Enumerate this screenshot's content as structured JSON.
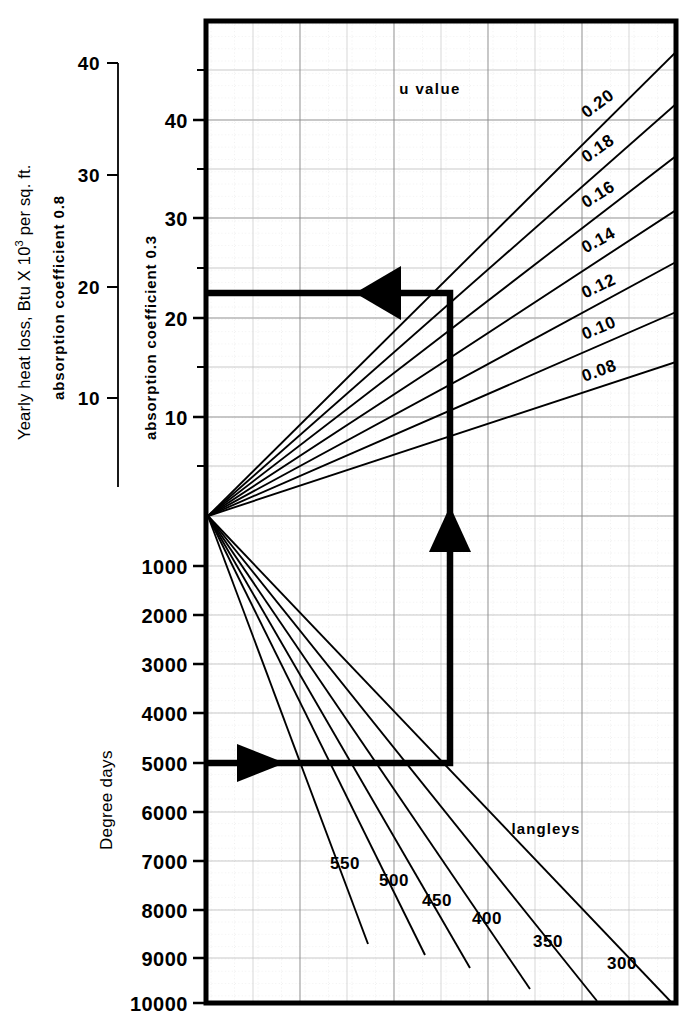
{
  "figure": {
    "type": "nomograph",
    "background": "#ffffff",
    "ink": "#000000",
    "gridline_color": "#9a9a9a",
    "subgrid_color": "#c9c9c9"
  },
  "left_outer_axis": {
    "title_line1": "Yearly heat loss, Btu X 10",
    "title_sup": "3",
    "title_line1_tail": " per sq. ft.",
    "title_line2": "absorption  coefficient  0.8",
    "ticks": [
      {
        "label": "40",
        "value": 40,
        "y": 63
      },
      {
        "label": "30",
        "value": 30,
        "y": 175
      },
      {
        "label": "20",
        "value": 20,
        "y": 287
      },
      {
        "label": "10",
        "value": 10,
        "y": 398
      }
    ],
    "axis_top_y": 63,
    "axis_bottom_y": 487,
    "axis_x": 118
  },
  "left_inner_axis": {
    "title": "absorption coefficient 0.3",
    "ticks": [
      {
        "label": "40",
        "value": 40,
        "y": 120
      },
      {
        "label": "30",
        "value": 30,
        "y": 218
      },
      {
        "label": "20",
        "value": 20,
        "y": 318
      },
      {
        "label": "10",
        "value": 10,
        "y": 417
      }
    ],
    "minor_ticks_y": [
      70,
      169,
      268,
      367,
      466
    ]
  },
  "degree_days_axis": {
    "title": "Degree days",
    "ticks": [
      {
        "label": "1000",
        "value": 1000,
        "y": 566
      },
      {
        "label": "2000",
        "value": 2000,
        "y": 615
      },
      {
        "label": "3000",
        "value": 3000,
        "y": 664
      },
      {
        "label": "4000",
        "value": 4000,
        "y": 713
      },
      {
        "label": "5000",
        "value": 5000,
        "y": 763
      },
      {
        "label": "6000",
        "value": 6000,
        "y": 812
      },
      {
        "label": "7000",
        "value": 7000,
        "y": 861
      },
      {
        "label": "8000",
        "value": 8000,
        "y": 910
      },
      {
        "label": "9000",
        "value": 9000,
        "y": 958
      },
      {
        "label": "10000",
        "value": 10000,
        "y": 1003
      }
    ]
  },
  "top_family": {
    "legend_label": "u value",
    "legend_x": 430,
    "legend_y": 89,
    "origin": {
      "x": 208,
      "y": 516
    },
    "lines": [
      {
        "label": "0.20",
        "value": 0.2,
        "end_x": 676,
        "end_y": 52,
        "lbl_x": 600,
        "lbl_y": 108,
        "rot": -36
      },
      {
        "label": "0.18",
        "value": 0.18,
        "end_x": 676,
        "end_y": 104,
        "lbl_x": 600,
        "lbl_y": 153,
        "rot": -34
      },
      {
        "label": "0.16",
        "value": 0.16,
        "end_x": 676,
        "end_y": 156,
        "lbl_x": 600,
        "lbl_y": 199,
        "rot": -31
      },
      {
        "label": "0.14",
        "value": 0.14,
        "end_x": 676,
        "end_y": 210,
        "lbl_x": 600,
        "lbl_y": 245,
        "rot": -28
      },
      {
        "label": "0.12",
        "value": 0.12,
        "end_x": 676,
        "end_y": 262,
        "lbl_x": 600,
        "lbl_y": 291,
        "rot": -25
      },
      {
        "label": "0.10",
        "value": 0.1,
        "end_x": 676,
        "end_y": 312,
        "lbl_x": 600,
        "lbl_y": 332,
        "rot": -22
      },
      {
        "label": "0.08",
        "value": 0.08,
        "end_x": 676,
        "end_y": 362,
        "lbl_x": 600,
        "lbl_y": 374,
        "rot": -19
      }
    ]
  },
  "bottom_family": {
    "legend_label": "langleys",
    "legend_x": 546,
    "legend_y": 828,
    "origin": {
      "x": 208,
      "y": 516
    },
    "lines": [
      {
        "label": "550",
        "value": 550,
        "end_x": 368,
        "end_y": 944,
        "lbl_x": 345,
        "lbl_y": 863
      },
      {
        "label": "500",
        "value": 500,
        "end_x": 425,
        "end_y": 955,
        "lbl_x": 394,
        "lbl_y": 880
      },
      {
        "label": "450",
        "value": 450,
        "end_x": 470,
        "end_y": 968,
        "lbl_x": 437,
        "lbl_y": 900
      },
      {
        "label": "400",
        "value": 400,
        "end_x": 530,
        "end_y": 989,
        "lbl_x": 487,
        "lbl_y": 918
      },
      {
        "label": "350",
        "value": 350,
        "end_x": 597,
        "end_y": 1001,
        "lbl_x": 548,
        "lbl_y": 941
      },
      {
        "label": "300",
        "value": 300,
        "end_x": 672,
        "end_y": 1003,
        "lbl_x": 622,
        "lbl_y": 963
      }
    ]
  },
  "worked_example": {
    "description": "heavy traced solution path",
    "degree_days": 5000,
    "heat_loss_read": 22,
    "segments": [
      {
        "from": [
          208,
          763
        ],
        "to": [
          450,
          763
        ],
        "arrow": "right",
        "arrow_at": [
          262,
          763
        ]
      },
      {
        "from": [
          450,
          763
        ],
        "to": [
          450,
          293
        ],
        "arrow": "up",
        "arrow_at": [
          450,
          527
        ]
      },
      {
        "from": [
          450,
          293
        ],
        "to": [
          208,
          293
        ],
        "arrow": "left",
        "arrow_at": [
          382,
          293
        ]
      }
    ]
  },
  "plot_frame": {
    "x": 206,
    "y": 21,
    "width": 470,
    "height": 982
  }
}
